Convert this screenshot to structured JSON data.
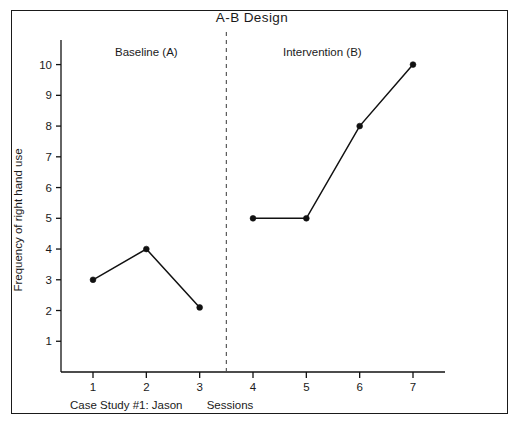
{
  "chart_data": {
    "type": "line",
    "title": "A-B   Design",
    "xlabel": "Sessions",
    "ylabel": "Frequency of right hand use",
    "caption": "Case Study #1: Jason",
    "x": [
      1,
      2,
      3,
      4,
      5,
      6,
      7
    ],
    "xticklabels": [
      "1",
      "2",
      "3",
      "4",
      "5",
      "6",
      "7"
    ],
    "yticklabels": [
      "1",
      "2",
      "3",
      "4",
      "5",
      "6",
      "7",
      "8",
      "9",
      "10"
    ],
    "yticks": [
      1,
      2,
      3,
      4,
      5,
      6,
      7,
      8,
      9,
      10
    ],
    "xlim": [
      0.4,
      7.6
    ],
    "ylim": [
      0,
      10.8
    ],
    "grid": false,
    "legend": null,
    "series": [
      {
        "name": "Baseline (A)",
        "x": [
          1,
          2,
          3
        ],
        "values": [
          3,
          4,
          2.1
        ]
      },
      {
        "name": "Intervention (B)",
        "x": [
          4,
          5,
          6,
          7
        ],
        "values": [
          5,
          5,
          8,
          10
        ]
      }
    ],
    "phases": [
      {
        "label": "Baseline (A)",
        "label_x": 2.0,
        "label_y": 10.4
      },
      {
        "label": "Intervention (B)",
        "label_x": 5.3,
        "label_y": 10.4
      }
    ],
    "phase_divider_x": 3.5,
    "colors": {
      "line": "#111111",
      "marker": "#111111",
      "axis": "#111111",
      "divider": "#4a4a4a",
      "frame": "#1a1a1a",
      "background": "#ffffff"
    }
  }
}
